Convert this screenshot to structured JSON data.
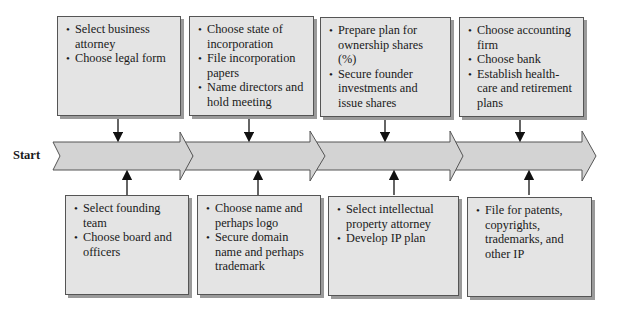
{
  "start_label": "Start",
  "stages": [
    {
      "top": [
        "Select business attorney",
        "Choose legal form"
      ],
      "bottom": [
        "Select founding team",
        "Choose board and officers"
      ]
    },
    {
      "top": [
        "Choose state of incorporation",
        "File incorporation papers",
        "Name directors and hold meeting"
      ],
      "bottom": [
        "Choose name and perhaps logo",
        "Secure domain name and perhaps trademark"
      ]
    },
    {
      "top": [
        "Prepare plan for ownership shares (%)",
        "Secure founder investments and issue shares"
      ],
      "bottom": [
        "Select intellectual property attorney",
        "Develop IP plan"
      ]
    },
    {
      "top": [
        "Choose accounting firm",
        "Choose bank",
        "Establish health-care and retirement plans"
      ],
      "bottom": [
        "File for patents, copyrights, trademarks, and other IP"
      ]
    }
  ],
  "colors": {
    "box_fill": "#e4e4e4",
    "arrow_fill": "#d3d3d3",
    "stroke": "#555555"
  }
}
